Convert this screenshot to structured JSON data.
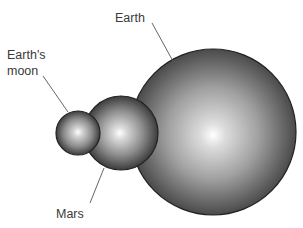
{
  "bodies": [
    {
      "id": "moon",
      "label_lines": [
        "Earth's",
        "moon"
      ],
      "relative_diameter": 0.27
    },
    {
      "id": "mars",
      "label_lines": [
        "Mars"
      ],
      "relative_diameter": 0.53
    },
    {
      "id": "earth",
      "label_lines": [
        "Earth"
      ],
      "relative_diameter": 1.0
    }
  ],
  "colors": {
    "sphere_highlight": "#ffffff",
    "sphere_shadow": "#3c3c3c",
    "outline": "#222222",
    "text": "#3a3a3a"
  }
}
